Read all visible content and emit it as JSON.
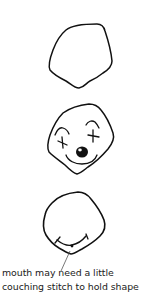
{
  "diagram": {
    "type": "step-illustration",
    "steps": [
      {
        "id": "step-1",
        "description": "blank head outline",
        "elements": [
          "head-outline"
        ]
      },
      {
        "id": "step-2",
        "description": "clown face with cross-stitch eyes, brows, round nose and smile",
        "elements": [
          "head-outline",
          "left-brow",
          "right-brow",
          "left-x-eye",
          "right-x-eye",
          "nose",
          "smile"
        ]
      },
      {
        "id": "step-3",
        "description": "head outline with couched mouth stitch",
        "elements": [
          "head-outline",
          "mouth-stitch",
          "couching-point",
          "leader-line"
        ]
      }
    ],
    "caption": {
      "line1": "mouth may need a little",
      "line2": "couching stitch to hold shape"
    },
    "colors": {
      "stroke": "#111111",
      "background": "#ffffff",
      "leader": "#555555"
    }
  }
}
